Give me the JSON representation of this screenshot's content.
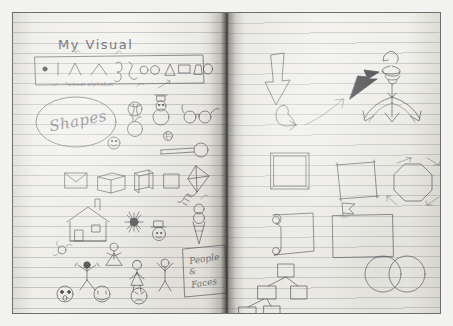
{
  "artifact": {
    "kind": "photo-of-open-notebook",
    "description": "Two-page hand-drawn sketchnoting practice spread in a ruled notebook",
    "paper_color": "#f3f2ed",
    "rule_line_color": "#6e7887",
    "ink_color": "#55555a",
    "frame_color": "#6e6e6e"
  },
  "left_page": {
    "title": "My Visual",
    "alphabet_box": {
      "caption": "\"visual alphabet\"",
      "glyph_names": [
        "dot",
        "vertical-line",
        "caret-up",
        "wide-caret",
        "hook-curve",
        "squiggle-curve",
        "circle-small",
        "circle-medium",
        "triangle",
        "rectangle",
        "trapezoid",
        "oval"
      ]
    },
    "shapes_label": "Shapes",
    "people_label_line1": "People",
    "people_label_amp": "&",
    "people_label_line2": "Faces",
    "object_rows": [
      {
        "row": "round-objects",
        "items": [
          "beach-ball-icon",
          "snowman-icon",
          "eyeglasses-icon",
          "apple-icon",
          "smiley-face-icon",
          "yarn-ball-icon",
          "magnifier-icon"
        ]
      },
      {
        "row": "boxes-and-flat-objects",
        "items": [
          "envelope-icon",
          "cube-icon",
          "book-icon",
          "square-icon",
          "kite-icon"
        ]
      },
      {
        "row": "scene-objects",
        "items": [
          "house-icon",
          "starburst-icon",
          "top-hat-face-icon",
          "ice-cream-cone-icon"
        ]
      },
      {
        "row": "people-figures",
        "items": [
          "flower-icon",
          "dancing-stick-figure",
          "stick-figure-arms-up",
          "girl-stick-figure",
          "stick-figure-cheering"
        ]
      },
      {
        "row": "faces",
        "items": [
          "surprised-face-icon",
          "happy-face-icon",
          "sad-face-icon"
        ]
      }
    ]
  },
  "right_page": {
    "title": "Tool Guide",
    "groups": [
      {
        "group": "arrows",
        "items": [
          "outline-down-arrow",
          "curved-hook-arrow",
          "thin-diagonal-arrow",
          "solid-filled-arrow",
          "coiled-spiral-arrow",
          "three-way-split-arrow"
        ]
      },
      {
        "group": "frames",
        "items": [
          "double-line-square-frame",
          "overlapping-corner-square",
          "octagon-with-arrow-accents"
        ]
      },
      {
        "group": "containers",
        "items": [
          "scroll-icon",
          "box-with-flag-banner"
        ]
      },
      {
        "group": "diagrams",
        "items": [
          "org-chart-hierarchy",
          "venn-diagram-two-circles"
        ]
      }
    ]
  }
}
